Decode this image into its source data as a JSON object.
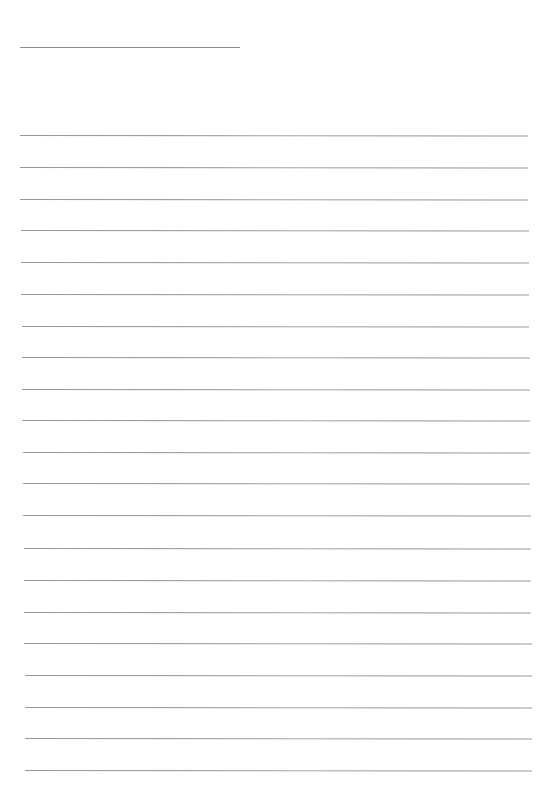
{
  "document": {
    "type": "lined-writing-page",
    "title_line": {
      "x1": 20,
      "x2": 240,
      "y": 47
    },
    "rule_color": "#959595",
    "rules": [
      {
        "y": 135,
        "x1": 20,
        "x2": 528
      },
      {
        "y": 167,
        "x1": 20,
        "x2": 528
      },
      {
        "y": 199,
        "x1": 20,
        "x2": 528
      },
      {
        "y": 230,
        "x1": 21,
        "x2": 529
      },
      {
        "y": 262,
        "x1": 21,
        "x2": 529
      },
      {
        "y": 294,
        "x1": 21,
        "x2": 529
      },
      {
        "y": 326,
        "x1": 22,
        "x2": 529
      },
      {
        "y": 357,
        "x1": 22,
        "x2": 530
      },
      {
        "y": 389,
        "x1": 22,
        "x2": 530
      },
      {
        "y": 420,
        "x1": 22,
        "x2": 530
      },
      {
        "y": 452,
        "x1": 23,
        "x2": 530
      },
      {
        "y": 483,
        "x1": 23,
        "x2": 530
      },
      {
        "y": 515,
        "x1": 23,
        "x2": 531
      },
      {
        "y": 548,
        "x1": 24,
        "x2": 531
      },
      {
        "y": 580,
        "x1": 24,
        "x2": 531
      },
      {
        "y": 612,
        "x1": 24,
        "x2": 531
      },
      {
        "y": 643,
        "x1": 24,
        "x2": 532
      },
      {
        "y": 675,
        "x1": 25,
        "x2": 532
      },
      {
        "y": 707,
        "x1": 25,
        "x2": 532
      },
      {
        "y": 738,
        "x1": 25,
        "x2": 532
      },
      {
        "y": 770,
        "x1": 25,
        "x2": 532
      }
    ]
  }
}
